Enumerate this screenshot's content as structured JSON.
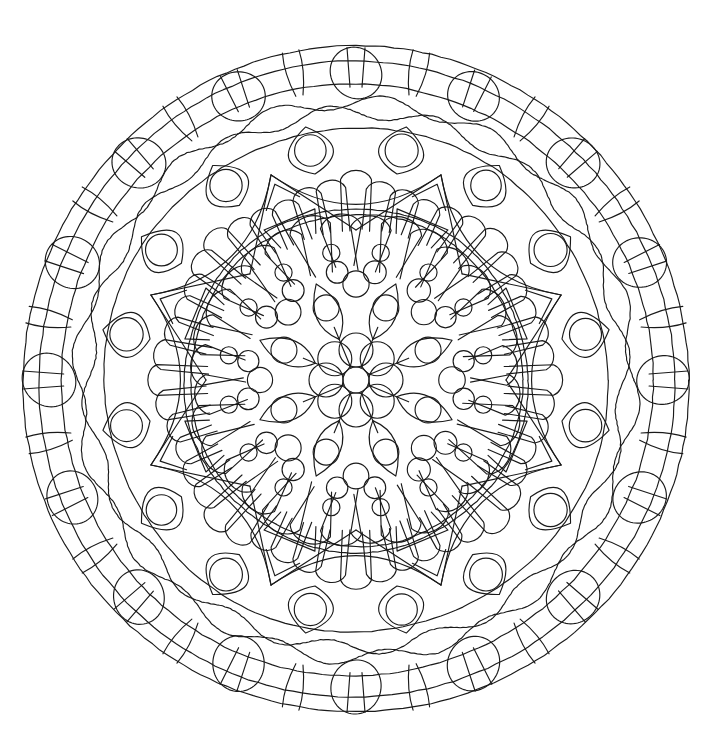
{
  "document": {
    "type": "mandala-coloring-page",
    "title": "Mandala Coloring Page",
    "background_color": "#ffffff",
    "line_color": "#1a1a1a",
    "line_width": 1.15,
    "canvas": {
      "width": 712,
      "height": 751
    }
  },
  "geometry": {
    "center_x": 356,
    "center_y": 380,
    "outer_radius": 333,
    "symmetry_order": 16,
    "inner_symmetry_order": 8
  },
  "rings": [
    {
      "name": "outer-boundary-ring",
      "label": "Outer boundary circles",
      "kind": "concentric-circles",
      "radii": [
        333,
        318,
        296
      ]
    },
    {
      "name": "outer-bead-ring",
      "label": "Outer large bead circles",
      "kind": "bead-circles",
      "count": 16,
      "orbit_radius": 307,
      "bead_radius": 26,
      "phase_deg": 0,
      "tick_marks": true
    },
    {
      "name": "outer-radial-strokes",
      "label": "Outer radial connector strokes",
      "kind": "radial-arcs",
      "count": 16,
      "r_inner": 296,
      "r_outer": 333,
      "bow": 10
    },
    {
      "name": "wavy-band",
      "label": "Wavy sine band",
      "kind": "wavy-rings",
      "radii": [
        278,
        268
      ],
      "waves": 16,
      "amplitude": 7
    },
    {
      "name": "mid-boundary-ring",
      "label": "Middle boundary circle",
      "kind": "concentric-circles",
      "radii": [
        252
      ]
    },
    {
      "name": "leaf-ring",
      "label": "Pointed leaf / lens ring",
      "kind": "leaf-lens",
      "count": 16,
      "r_inner": 214,
      "r_outer": 252,
      "half_width_deg": 11.25,
      "small_circle_radius": 16,
      "small_circle_orbit": 234
    },
    {
      "name": "star-ring",
      "label": "Eight pointed star / arrow spikes",
      "kind": "star-spikes",
      "count": 8,
      "r_tip": 222,
      "r_base": 150,
      "phase_deg": 22.5,
      "notch": 0.42
    },
    {
      "name": "petal-ring-outer",
      "label": "Outer rounded petal fingers",
      "kind": "petal-fingers",
      "count": 48,
      "r_inner": 150,
      "r_outer": 200,
      "petal_width_deg": 5.2
    },
    {
      "name": "inner-core-ring",
      "label": "Inner core boundary circle",
      "kind": "concentric-circles",
      "radii": [
        172,
        166
      ]
    },
    {
      "name": "petal-ring-inner",
      "label": "Inner rounded petal ring",
      "kind": "petal-fingers",
      "count": 32,
      "r_inner": 112,
      "r_outer": 162,
      "petal_width_deg": 7.6
    },
    {
      "name": "bubble-cluster-ring",
      "label": "Bubble cluster ring",
      "kind": "bubble-clusters",
      "count": 8,
      "orbit_radius": 96,
      "cluster_radius": 13
    },
    {
      "name": "inner-lens-ring",
      "label": "Inner lens / almond ring",
      "kind": "lens-ring",
      "count": 8,
      "r_inner": 44,
      "r_outer": 104,
      "half_width_deg": 20
    },
    {
      "name": "center-rosette",
      "label": "Center rosette of circles",
      "kind": "center-rosette",
      "petal_count": 8,
      "petal_orbit": 30,
      "petal_radius": 17,
      "hub_radius": 13
    }
  ],
  "legend": {
    "description": "Symmetric circular mandala line drawing for coloring, composed of concentric decorative bands.",
    "bands_outward_in": [
      "Outer triple boundary circles",
      "Ring of 16 large beads with radial tick marks",
      "Double wavy sine band",
      "Ring of 16 pointed lens leaves with small circles",
      "Eight-point star with arrow-notched spikes",
      "Radial rounded petal fingers",
      "Inner core double circle",
      "Inner petal ring and bubble clusters",
      "Center rosette of eight circles around a hub"
    ]
  }
}
